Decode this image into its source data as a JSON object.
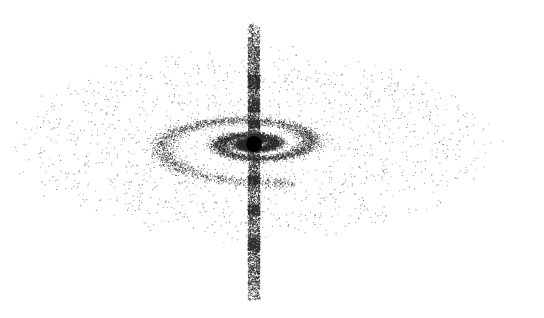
{
  "illustration": {
    "subject": "stippled spiral galaxy with central black hole and vertical jet",
    "width": 544,
    "height": 318,
    "background": "#ffffff",
    "ink_color": "#2a2a2a",
    "seed": 1337
  },
  "black_hole": {
    "cx": 254,
    "cy": 144,
    "r": 8,
    "color": "#000000"
  },
  "jet": {
    "x": 254,
    "y_top": 24,
    "y_bottom": 300,
    "width": 12,
    "density": 1.4,
    "dense_bands": [
      {
        "y": 75,
        "h": 14
      },
      {
        "y": 100,
        "h": 12
      },
      {
        "y": 120,
        "h": 8
      },
      {
        "y": 175,
        "h": 10
      },
      {
        "y": 205,
        "h": 10
      },
      {
        "y": 238,
        "h": 12
      }
    ]
  },
  "galaxy": {
    "cx": 254,
    "cy": 144,
    "x_scale": 1.0,
    "y_scale": 0.33,
    "spiral": {
      "a": 8,
      "b": 0.155,
      "theta_start": 0.6,
      "theta_end": 17.6,
      "arm_width": 17,
      "points": 9000
    },
    "halo": {
      "rx": 240,
      "ry": 96,
      "points": 1500
    }
  }
}
